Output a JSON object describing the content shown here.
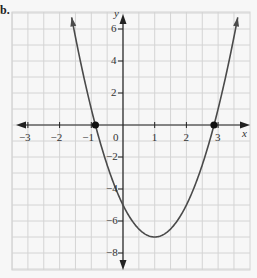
{
  "part_label": "b.",
  "chart_data": {
    "type": "line",
    "title": "",
    "function": "y = 2x^2 - 4x - 5",
    "xlabel": "x",
    "ylabel": "y",
    "xlim": [
      -3.5,
      3.9
    ],
    "ylim": [
      -9,
      7
    ],
    "grid": true,
    "x_ticks": [
      -3,
      -2,
      -1,
      0,
      1,
      2,
      3
    ],
    "x_tick_labels": [
      "−3",
      "−2",
      "−1",
      "0",
      "1",
      "2",
      "3"
    ],
    "y_ticks": [
      6,
      4,
      2,
      -2,
      -4,
      -6,
      -8
    ],
    "y_tick_labels": [
      "6",
      "4",
      "2",
      "−2",
      "−4",
      "−6",
      "−8"
    ],
    "vertex": {
      "x": 1,
      "y": -7
    },
    "y_intercept": -5,
    "marked_points": [
      {
        "x": -0.87,
        "y": 0,
        "label": "x-intercept"
      },
      {
        "x": 2.87,
        "y": 0,
        "label": "x-intercept"
      }
    ],
    "x": [
      -1.6,
      -1.0,
      -0.87,
      0,
      0.5,
      1,
      1.5,
      2,
      2.87,
      3.6
    ],
    "values": [
      6.3,
      1.0,
      0,
      -5,
      -6.5,
      -7,
      -6.5,
      -5,
      0,
      6.5
    ]
  },
  "colors": {
    "background": "#f7f7f7",
    "grid": "#d4d4d4",
    "axis": "#222222",
    "curve": "#4a4a4a",
    "point": "#111111"
  }
}
